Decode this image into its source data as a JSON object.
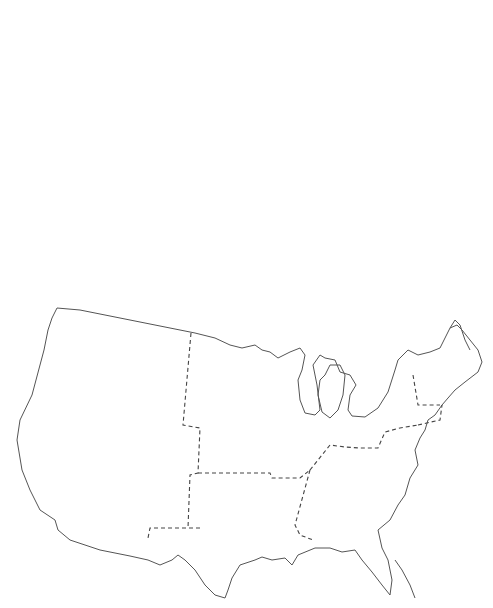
{
  "colors": {
    "dark_bar": "#333333",
    "hatch_bar_bg": "#ffffff",
    "hatch_stroke": "#555555",
    "light_bar": "#e0e0e0",
    "axis": "#555555",
    "text": "#444444"
  },
  "chart_data": [
    {
      "type": "bar",
      "title": "Population (millions)",
      "categories": [
        "1790",
        "1830"
      ],
      "values": [
        3.9,
        12.9
      ],
      "ylim": [
        0,
        15
      ],
      "yticks": [
        "0",
        "3",
        "6",
        "9",
        "12",
        "15"
      ]
    },
    {
      "type": "bar",
      "title": "GNP (billions, 1860$)",
      "categories": [
        "1790",
        "1830"
      ],
      "values": [
        0.17,
        1.03
      ],
      "ylim": [
        0,
        1.2
      ],
      "yticks": [
        "0.0",
        "0.2",
        "0.4",
        "0.6",
        "0.8",
        "1.0",
        "1.2"
      ]
    },
    {
      "type": "bar",
      "title": "GNP/Capita (1860$)",
      "categories": [
        "1790",
        "1830"
      ],
      "values": [
        44,
        80
      ],
      "ylim": [
        0,
        100
      ],
      "yticks": [
        "0",
        "20",
        "40",
        "60",
        "80",
        "100"
      ]
    },
    {
      "type": "bar",
      "title": "Settled Area",
      "subtitle": "(millions, sq. miles)",
      "categories": [
        "1790",
        "1830"
      ],
      "values": [
        0.24,
        0.61
      ],
      "ylim": [
        0,
        0.8
      ],
      "yticks": [
        "0.0",
        "0.1",
        "0.2",
        "0.3",
        "0.4",
        "0.5",
        "0.6",
        "0.7",
        "0.8"
      ]
    },
    {
      "type": "bar",
      "title": "Net Immigrants",
      "subtitle": "(millions)",
      "categories": [
        "1790-1830",
        "1830-1880"
      ],
      "values": [
        0.4,
        9.7
      ],
      "ylim": [
        0,
        10
      ],
      "yticks": [
        "0",
        "2",
        "4",
        "6",
        "8",
        "10"
      ]
    },
    {
      "type": "bar",
      "title": "Exports/Imports",
      "subtitle": "(billions, 1860$)",
      "categories": [
        "1790",
        "1830"
      ],
      "series": [
        {
          "name": "Exp.",
          "values": [
            0.21,
            0.81
          ]
        },
        {
          "name": "Imp.",
          "values": [
            0.24,
            0.78
          ]
        }
      ],
      "ylim": [
        0,
        1.0
      ],
      "yticks": [
        "0.0",
        "0.2",
        "0.4",
        "0.6",
        "0.8",
        "1.0"
      ]
    },
    {
      "type": "bar",
      "title": "Exports/Capita",
      "subtitle": "(1860$)",
      "categories": [
        "1790",
        "1830"
      ],
      "values": [
        55,
        63
      ],
      "ylim": [
        0,
        80
      ],
      "yticks": [
        "0",
        "10",
        "20",
        "30",
        "40",
        "50",
        "60",
        "70",
        "80"
      ]
    },
    {
      "type": "bar",
      "title": "Northwest region (map inset)",
      "series": [
        {
          "name": "Percent Population",
          "category": "1830",
          "value": 18,
          "ylim": [
            0,
            100
          ],
          "yticks": [
            "0",
            "20",
            "40",
            "60",
            "80",
            "100"
          ]
        },
        {
          "name": "Income/Capita",
          "category": "1840",
          "value": 68,
          "ylim": [
            0,
            150
          ],
          "yticks": [
            "0",
            "30",
            "60",
            "90",
            "120",
            "150"
          ]
        },
        {
          "name": "Industrial Labor Force Index",
          "category": "1840",
          "value": 85,
          "ylim": [
            0,
            200
          ],
          "yticks": [
            "0",
            "50",
            "100",
            "150",
            "200"
          ]
        }
      ]
    },
    {
      "type": "bar",
      "title": "Northeast region (map inset)",
      "series": [
        {
          "name": "Percent Population",
          "category": "1830",
          "value": 43,
          "ylim": [
            0,
            100
          ],
          "yticks": [
            "0",
            "20",
            "40",
            "60",
            "80",
            "100"
          ]
        },
        {
          "name": "Income/Capita",
          "category": "1840",
          "value": 135,
          "ylim": [
            0,
            150
          ],
          "yticks": [
            "0",
            "30",
            "60",
            "90",
            "120",
            "150"
          ]
        },
        {
          "name": "Industrial Labor Force Index",
          "category": "1840",
          "value": 163,
          "ylim": [
            0,
            200
          ],
          "yticks": [
            "0",
            "50",
            "100",
            "150",
            "200"
          ]
        }
      ]
    },
    {
      "type": "bar",
      "title": "Southwest region (map inset)",
      "series": [
        {
          "name": "Percent Population",
          "category": "1830",
          "value": 2,
          "ylim": [
            0,
            100
          ],
          "yticks": [
            "0",
            "20",
            "40",
            "60",
            "80",
            "100"
          ]
        },
        {
          "name": "Income/Capita",
          "category": "1840",
          "value": 144,
          "ylim": [
            0,
            150
          ],
          "yticks": [
            "0",
            "30",
            "60",
            "90",
            "120",
            "150"
          ]
        },
        {
          "name": "Industrial Labor Force Index",
          "category": "1840",
          "value": 68,
          "ylim": [
            0,
            200
          ],
          "yticks": [
            "0",
            "50",
            "100",
            "150",
            "200"
          ]
        }
      ]
    },
    {
      "type": "bar",
      "title": "Southeast region (map inset)",
      "series": [
        {
          "name": "Percent Population",
          "category": "1830",
          "value": 35,
          "ylim": [
            0,
            100
          ],
          "yticks": [
            "0",
            "20",
            "40",
            "60",
            "80",
            "100"
          ]
        },
        {
          "name": "Income/Capita",
          "category": "1840",
          "value": 72,
          "ylim": [
            0,
            150
          ],
          "yticks": [
            "0",
            "30",
            "60",
            "90",
            "120",
            "150"
          ]
        },
        {
          "name": "Industrial Labor Force Index",
          "category": "1840",
          "value": 45,
          "ylim": [
            0,
            200
          ],
          "yticks": [
            "0",
            "50",
            "100",
            "150",
            "200"
          ]
        }
      ]
    }
  ],
  "legend": {
    "items": [
      {
        "label": "Percent Population",
        "style": "dark"
      },
      {
        "label": "Income/Capita",
        "style": "hatch"
      },
      {
        "label": "Industrial Labor",
        "label2": "Force Index",
        "style": "light"
      }
    ]
  }
}
